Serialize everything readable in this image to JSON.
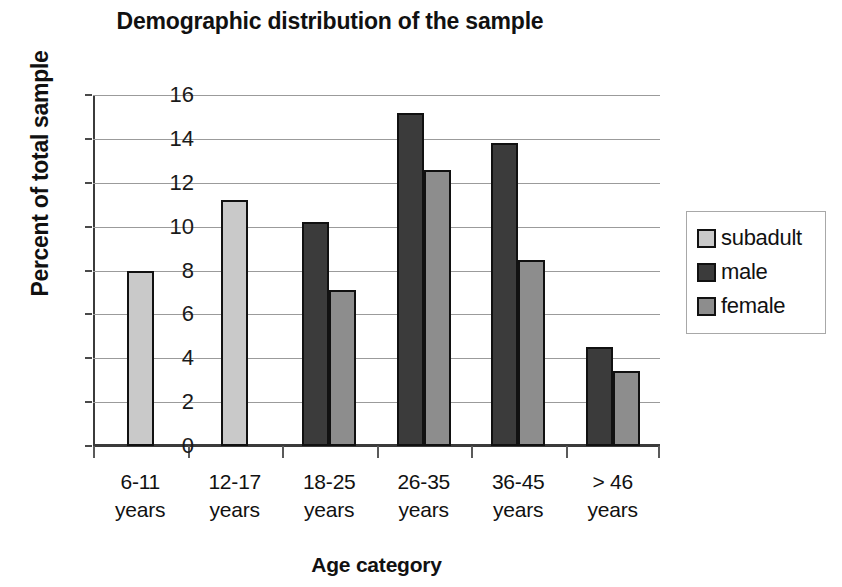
{
  "chart_data": {
    "type": "bar",
    "title": "Demographic distribution of the sample",
    "xlabel": "Age category",
    "ylabel": "Percent of total sample",
    "categories": [
      "6-11\nyears",
      "12-17\nyears",
      "18-25\nyears",
      "26-35\nyears",
      "36-45\nyears",
      "> 46\nyears"
    ],
    "category_lines": [
      [
        "6-11",
        "years"
      ],
      [
        "12-17",
        "years"
      ],
      [
        "18-25",
        "years"
      ],
      [
        "26-35",
        "years"
      ],
      [
        "36-45",
        "years"
      ],
      [
        "> 46",
        "years"
      ]
    ],
    "series": [
      {
        "name": "subadult",
        "color": "#c9c9c9",
        "values": [
          8.0,
          11.2,
          null,
          null,
          null,
          null
        ]
      },
      {
        "name": "male",
        "color": "#3b3b3b",
        "values": [
          null,
          null,
          10.2,
          15.2,
          13.8,
          4.5
        ]
      },
      {
        "name": "female",
        "color": "#8d8d8d",
        "values": [
          null,
          null,
          7.1,
          12.6,
          8.5,
          3.4
        ]
      }
    ],
    "ylim": [
      0,
      16
    ],
    "ytick_step": 2,
    "ytick_labels": [
      "16",
      "14",
      "12",
      "10",
      "8",
      "6",
      "4",
      "2",
      "0"
    ],
    "grid": true,
    "legend_position": "right"
  },
  "legend": {
    "items": [
      {
        "label": "subadult",
        "key": "subadult"
      },
      {
        "label": "male",
        "key": "male"
      },
      {
        "label": "female",
        "key": "female"
      }
    ]
  }
}
